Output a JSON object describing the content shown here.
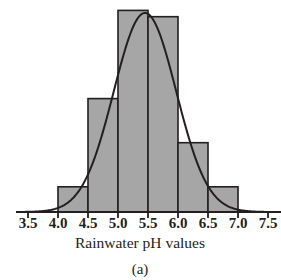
{
  "figure": {
    "panel_label": "(a)",
    "axis_title": "Rainwater pH values",
    "bar_fill_color": "#a6a6a6",
    "bar_stroke_color": "#231f20",
    "curve_color": "#231f20",
    "axis_color": "#231f20",
    "background_color": "#ffffff"
  },
  "chart_data": {
    "type": "bar",
    "title": "",
    "subtitle": "",
    "xlabel": "Rainwater pH values",
    "ylabel": "",
    "categories": [
      "3.5-4.0",
      "4.0-4.5",
      "4.5-5.0",
      "5.0-5.5",
      "5.5-6.0",
      "6.0-6.5",
      "6.5-7.0",
      "7.0-7.5"
    ],
    "bin_edges": [
      3.5,
      4.0,
      4.5,
      5.0,
      5.5,
      6.0,
      6.5,
      7.0,
      7.5
    ],
    "values": [
      0,
      2,
      9,
      16,
      15.5,
      5.5,
      2,
      0
    ],
    "bin_width": 0.5,
    "xlim": [
      3.4,
      7.6
    ],
    "ylim": [
      0,
      16.5
    ],
    "xticks": [
      3.5,
      4.0,
      4.5,
      5.0,
      5.5,
      6.0,
      6.5,
      7.0,
      7.5
    ],
    "xtick_labels": [
      "3.5",
      "4.0",
      "4.5",
      "5.0",
      "5.5",
      "6.0",
      "6.5",
      "7.0",
      "7.5"
    ],
    "yticks": [],
    "ytick_labels": [],
    "grid": false,
    "legend": false,
    "legend_position": "none",
    "annotations": [
      "(a)"
    ],
    "overlay": {
      "type": "line",
      "name": "normal density curve",
      "mean": 5.45,
      "std_dev": 0.52,
      "peak_value": 15.8,
      "description": "Smooth bell-shaped normal curve fitted over the histogram"
    }
  }
}
